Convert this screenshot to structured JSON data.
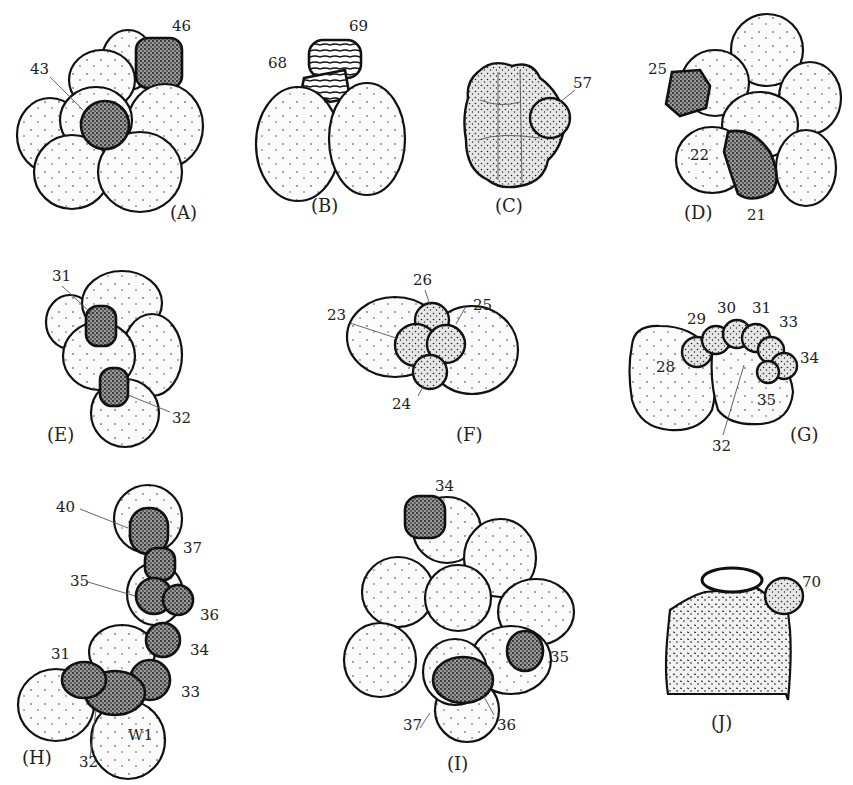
{
  "figure": {
    "panels": [
      {
        "id": "A",
        "label": "(A)",
        "annotations": [
          "46",
          "43"
        ]
      },
      {
        "id": "B",
        "label": "(B)",
        "annotations": [
          "69",
          "68"
        ]
      },
      {
        "id": "C",
        "label": "(C)",
        "annotations": [
          "57"
        ]
      },
      {
        "id": "D",
        "label": "(D)",
        "annotations": [
          "25",
          "22",
          "21"
        ]
      },
      {
        "id": "E",
        "label": "(E)",
        "annotations": [
          "31",
          "32"
        ]
      },
      {
        "id": "F",
        "label": "(F)",
        "annotations": [
          "26",
          "23",
          "25",
          "24"
        ]
      },
      {
        "id": "G",
        "label": "(G)",
        "annotations": [
          "29",
          "30",
          "31",
          "33",
          "28",
          "34",
          "35",
          "32"
        ]
      },
      {
        "id": "H",
        "label": "(H)",
        "annotations": [
          "40",
          "37",
          "35",
          "36",
          "34",
          "31",
          "33",
          "W1",
          "32"
        ]
      },
      {
        "id": "I",
        "label": "(I)",
        "annotations": [
          "34",
          "35",
          "37",
          "36"
        ]
      },
      {
        "id": "J",
        "label": "(J)",
        "annotations": [
          "70"
        ]
      }
    ]
  }
}
